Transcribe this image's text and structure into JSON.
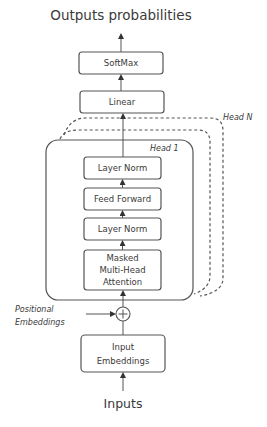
{
  "diagram": {
    "title": "Outputs probabilities",
    "input_label": "Inputs",
    "blocks": {
      "softmax": "SoftMax",
      "linear": "Linear",
      "layer_norm_top": "Layer Norm",
      "feed_forward": "Feed Forward",
      "layer_norm_bottom": "Layer Norm",
      "masked_mha": [
        "Masked",
        "Multi-Head",
        "Attention"
      ],
      "input_embeddings": [
        "Input",
        "Embeddings"
      ]
    },
    "heads": {
      "first": "Head 1",
      "last": "Head N"
    },
    "positional_embeddings": [
      "Positional",
      "Embeddings"
    ],
    "combine_symbol": "+",
    "colors": {
      "stroke": "#555555",
      "text": "#3a3a3a",
      "background": "#ffffff"
    }
  }
}
